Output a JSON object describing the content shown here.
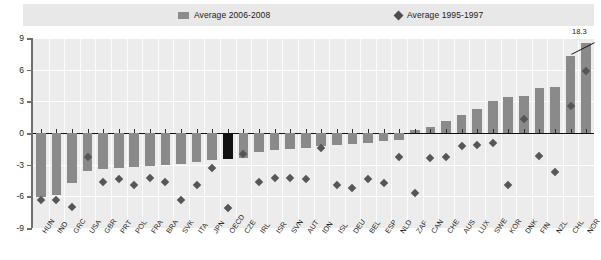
{
  "legend": {
    "items": [
      {
        "label": "Average 2006-2008",
        "marker": "bar-swatch-icon",
        "color": "#8c8c8c"
      },
      {
        "label": "Average  1995-1997",
        "marker": "diamond-marker-icon",
        "color": "#4d4d4d"
      }
    ]
  },
  "annotations": {
    "truncated_value_label": "18.3"
  },
  "chart_data": {
    "type": "bar",
    "title": "",
    "subtitle": "",
    "xlabel": "",
    "ylabel": "",
    "ylim": [
      -9,
      9
    ],
    "yticks": [
      9,
      6,
      3,
      0,
      -3,
      -6,
      -9
    ],
    "ytick_labels": [
      "9",
      "6",
      "3",
      "0",
      "-3",
      "-6",
      "-9"
    ],
    "grid": true,
    "legend_position": "top",
    "highlight_category": "OECD",
    "highlight_color": "#121212",
    "bar_color": "#8a8a8a",
    "marker_color": "#565656",
    "truncated_bars": [
      {
        "category": "NOR",
        "true_value": 18.3,
        "drawn_to": 8.5
      }
    ],
    "categories": [
      "HUN",
      "IND",
      "GRC",
      "USA",
      "GBR",
      "PRT",
      "POL",
      "FRA",
      "BRA",
      "SVK",
      "ITA",
      "JPN",
      "OECD",
      "CZE",
      "IRL",
      "ISR",
      "SVN",
      "AUT",
      "IDN",
      "ISL",
      "DEU",
      "BEL",
      "ESP",
      "NLD",
      "ZAF",
      "CAN",
      "CHE",
      "AUS",
      "LUX",
      "SWE",
      "KOR",
      "DNK",
      "FIN",
      "NZL",
      "CHL",
      "NOR"
    ],
    "series": [
      {
        "name": "Average 2006-2008",
        "type": "bar",
        "values": [
          -6.1,
          -5.9,
          -4.7,
          -3.6,
          -3.4,
          -3.3,
          -3.2,
          -3.1,
          -3.0,
          -2.9,
          -2.7,
          -2.6,
          -2.5,
          -2.4,
          -1.8,
          -1.6,
          -1.5,
          -1.4,
          -1.2,
          -1.1,
          -1.0,
          -0.9,
          -0.8,
          -0.7,
          0.3,
          0.6,
          1.1,
          1.7,
          2.3,
          3.0,
          3.4,
          3.5,
          4.3,
          4.4,
          7.3,
          18.3
        ]
      },
      {
        "name": "Average  1995-1997",
        "type": "scatter",
        "values": [
          -6.3,
          -6.3,
          -7.0,
          -2.3,
          -4.6,
          -4.4,
          -4.9,
          -4.3,
          -4.6,
          -6.3,
          -4.9,
          -3.3,
          -7.1,
          -2.0,
          -4.6,
          -4.3,
          -4.3,
          -4.4,
          -1.4,
          -4.9,
          -5.2,
          -4.4,
          -4.7,
          -2.3,
          -5.7,
          -2.4,
          -2.3,
          -1.2,
          -1.1,
          -0.9,
          -4.9,
          1.3,
          -2.2,
          -3.7,
          2.6,
          5.9
        ]
      }
    ]
  }
}
